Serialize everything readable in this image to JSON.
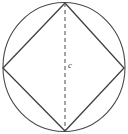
{
  "figure": {
    "background_color": "#ffffff",
    "width": 128,
    "height": 134,
    "labels": {
      "diameter": "c"
    },
    "colors": {
      "circle_stroke": "#4a4a4a",
      "square_stroke": "#3f3f3f",
      "dashed_stroke": "#5a5a5a",
      "label_color": "#3a3a3a"
    },
    "geometry": {
      "circle": {
        "center_x": 64,
        "center_y": 67,
        "radius_x": 61,
        "radius_y": 64.5,
        "stroke_width": 1.1
      },
      "square": {
        "description": "inscribed square rotated 45 degrees (diamond)",
        "vertices": [
          {
            "name": "top",
            "x": 65,
            "y": 3
          },
          {
            "name": "right",
            "x": 124,
            "y": 68
          },
          {
            "name": "bottom",
            "x": 65,
            "y": 131
          },
          {
            "name": "left",
            "x": 3,
            "y": 68
          }
        ],
        "stroke_width": 1.3
      },
      "diameter_line": {
        "style": "dashed",
        "dash_pattern": "4 3",
        "x1": 65,
        "y1": 3,
        "x2": 65,
        "y2": 131,
        "stroke_width": 1.1
      }
    }
  }
}
